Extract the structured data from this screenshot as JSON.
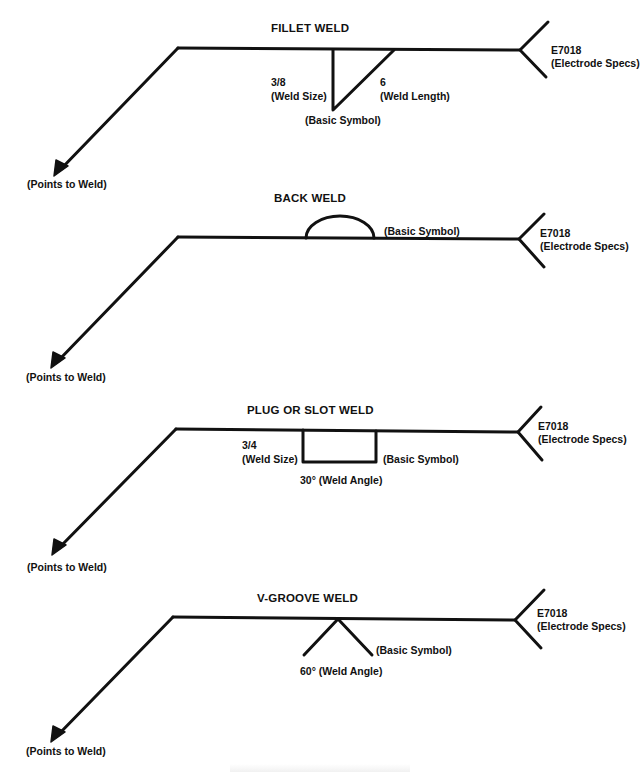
{
  "figure": {
    "panels": [
      {
        "title": "FILLET WELD",
        "electrode": {
          "code": "E7018",
          "desc": "(Electrode Specs)"
        },
        "arrow_label": "(Points to Weld)",
        "symbol_label": "(Basic Symbol)",
        "size_value": "3/8",
        "size_label": "(Weld Size)",
        "length_value": "6",
        "length_label": "(Weld Length)"
      },
      {
        "title": "BACK WELD",
        "electrode": {
          "code": "E7018",
          "desc": "(Electrode Specs)"
        },
        "arrow_label": "(Points to Weld)",
        "symbol_label": "(Basic Symbol)"
      },
      {
        "title": "PLUG OR SLOT WELD",
        "electrode": {
          "code": "E7018",
          "desc": "(Electrode Specs)"
        },
        "arrow_label": "(Points to Weld)",
        "symbol_label": "(Basic Symbol)",
        "size_value": "3/4",
        "size_label": "(Weld Size)",
        "angle_label": "30° (Weld Angle)"
      },
      {
        "title": "V-GROOVE WELD",
        "electrode": {
          "code": "E7018",
          "desc": "(Electrode Specs)"
        },
        "arrow_label": "(Points to Weld)",
        "symbol_label": "(Basic Symbol)",
        "angle_label": "60° (Weld Angle)"
      }
    ],
    "line_color": "#111111",
    "background": "#ffffff"
  }
}
